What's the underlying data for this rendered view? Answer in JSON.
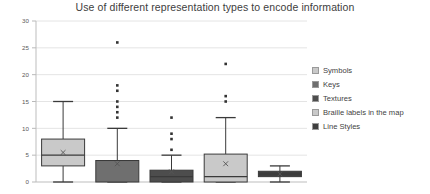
{
  "chart_data": {
    "type": "box",
    "title": "Use of different representation types to encode information",
    "xlabel": "",
    "ylabel": "",
    "ylim": [
      0,
      30
    ],
    "yticks": [
      0,
      5,
      10,
      15,
      20,
      25,
      30
    ],
    "grid": true,
    "legend_position": "right",
    "categories": [
      "Symbols",
      "Keys",
      "Textures",
      "Braille labels in the map",
      "Line Styles"
    ],
    "series": [
      {
        "name": "Symbols",
        "color": "#c9c9c9",
        "min": 0,
        "q1": 3,
        "median": 5,
        "q3": 8,
        "max": 15,
        "mean": 5.5,
        "outliers": []
      },
      {
        "name": "Keys",
        "color": "#6f6f6f",
        "min": 0,
        "q1": 0,
        "median": 4,
        "q3": 4,
        "max": 10,
        "mean": 3.4,
        "outliers": [
          12,
          13,
          14,
          15,
          17,
          18,
          26
        ]
      },
      {
        "name": "Textures",
        "color": "#4d4d4d",
        "min": 0,
        "q1": 0,
        "median": 1,
        "q3": 2.2,
        "max": 5,
        "mean": 1.9,
        "outliers": [
          6,
          8,
          9,
          12
        ]
      },
      {
        "name": "Braille labels in the map",
        "color": "#c9c9c9",
        "min": 0,
        "q1": 0,
        "median": 1,
        "q3": 5.2,
        "max": 12,
        "mean": 3.4,
        "outliers": [
          15,
          16,
          22
        ]
      },
      {
        "name": "Line Styles",
        "color": "#3f3f3f",
        "min": 0,
        "q1": 1,
        "median": 1.5,
        "q3": 2,
        "max": 3,
        "mean": 1.5,
        "outliers": []
      }
    ]
  },
  "legend": {
    "items": [
      {
        "label": "Symbols",
        "color": "#c9c9c9"
      },
      {
        "label": "Keys",
        "color": "#6f6f6f"
      },
      {
        "label": "Textures",
        "color": "#4d4d4d"
      },
      {
        "label": "Braille labels in the map",
        "color": "#c9c9c9"
      },
      {
        "label": "Line Styles",
        "color": "#3f3f3f"
      }
    ]
  }
}
